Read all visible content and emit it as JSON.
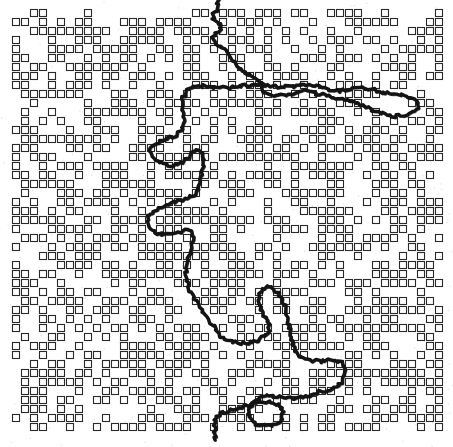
{
  "figure": {
    "title": "Percolation cluster lattice with hull walk",
    "width": 453,
    "height": 447,
    "background_color": "#ffffff"
  },
  "lattice": {
    "name": "occupied-site-lattice",
    "cell_size": 9,
    "cell_box": 7,
    "origin_x": 12,
    "origin_y": 9,
    "cols": 48,
    "rows": 47,
    "occupation_probability": 0.56,
    "square_stroke_color": "#2a2a2a",
    "square_stroke_width": 1.1,
    "square_fill": "none",
    "seed": 20240517
  },
  "hull": {
    "name": "hull-walk-path",
    "stroke_color": "#141414",
    "stroke_width": 3.4,
    "jitter_amplitude": 1.6,
    "entry_label": "top",
    "exit_label": "bottom",
    "points": [
      [
        218,
        0
      ],
      [
        218,
        9
      ],
      [
        214,
        12
      ],
      [
        213,
        19
      ],
      [
        217,
        22
      ],
      [
        221,
        24
      ],
      [
        221,
        31
      ],
      [
        216,
        34
      ],
      [
        213,
        38
      ],
      [
        215,
        44
      ],
      [
        220,
        47
      ],
      [
        226,
        50
      ],
      [
        230,
        56
      ],
      [
        234,
        60
      ],
      [
        238,
        66
      ],
      [
        243,
        70
      ],
      [
        248,
        74
      ],
      [
        253,
        78
      ],
      [
        258,
        80
      ],
      [
        262,
        85
      ],
      [
        264,
        91
      ],
      [
        269,
        94
      ],
      [
        275,
        95
      ],
      [
        282,
        95
      ],
      [
        289,
        95
      ],
      [
        296,
        93
      ],
      [
        303,
        91
      ],
      [
        310,
        92
      ],
      [
        317,
        94
      ],
      [
        324,
        95
      ],
      [
        331,
        97
      ],
      [
        338,
        98
      ],
      [
        345,
        100
      ],
      [
        352,
        102
      ],
      [
        359,
        104
      ],
      [
        366,
        107
      ],
      [
        373,
        110
      ],
      [
        380,
        113
      ],
      [
        387,
        115
      ],
      [
        394,
        116
      ],
      [
        401,
        116
      ],
      [
        408,
        114
      ],
      [
        414,
        111
      ],
      [
        418,
        107
      ],
      [
        419,
        102
      ],
      [
        416,
        98
      ],
      [
        409,
        96
      ],
      [
        402,
        95
      ],
      [
        395,
        94
      ],
      [
        388,
        93
      ],
      [
        381,
        92
      ],
      [
        374,
        90
      ],
      [
        367,
        88
      ],
      [
        360,
        87
      ],
      [
        353,
        88
      ],
      [
        346,
        90
      ],
      [
        339,
        91
      ],
      [
        332,
        90
      ],
      [
        325,
        88
      ],
      [
        318,
        86
      ],
      [
        311,
        85
      ],
      [
        304,
        85
      ],
      [
        297,
        86
      ],
      [
        290,
        87
      ],
      [
        283,
        87
      ],
      [
        276,
        86
      ],
      [
        269,
        85
      ],
      [
        262,
        84
      ],
      [
        255,
        84
      ],
      [
        248,
        85
      ],
      [
        241,
        86
      ],
      [
        234,
        87
      ],
      [
        227,
        88
      ],
      [
        220,
        88
      ],
      [
        213,
        87
      ],
      [
        206,
        86
      ],
      [
        199,
        86
      ],
      [
        192,
        88
      ],
      [
        186,
        92
      ],
      [
        183,
        98
      ],
      [
        182,
        105
      ],
      [
        183,
        112
      ],
      [
        184,
        119
      ],
      [
        184,
        126
      ],
      [
        181,
        132
      ],
      [
        175,
        136
      ],
      [
        168,
        138
      ],
      [
        161,
        140
      ],
      [
        155,
        143
      ],
      [
        151,
        148
      ],
      [
        150,
        154
      ],
      [
        153,
        159
      ],
      [
        158,
        162
      ],
      [
        164,
        164
      ],
      [
        171,
        165
      ],
      [
        178,
        164
      ],
      [
        184,
        161
      ],
      [
        189,
        157
      ],
      [
        193,
        152
      ],
      [
        197,
        148
      ],
      [
        201,
        152
      ],
      [
        203,
        158
      ],
      [
        203,
        165
      ],
      [
        202,
        172
      ],
      [
        201,
        179
      ],
      [
        200,
        186
      ],
      [
        197,
        192
      ],
      [
        192,
        196
      ],
      [
        186,
        199
      ],
      [
        179,
        201
      ],
      [
        172,
        203
      ],
      [
        165,
        205
      ],
      [
        158,
        208
      ],
      [
        152,
        212
      ],
      [
        148,
        217
      ],
      [
        147,
        224
      ],
      [
        150,
        230
      ],
      [
        156,
        233
      ],
      [
        163,
        234
      ],
      [
        170,
        234
      ],
      [
        177,
        233
      ],
      [
        183,
        231
      ],
      [
        188,
        228
      ],
      [
        192,
        233
      ],
      [
        193,
        240
      ],
      [
        192,
        247
      ],
      [
        190,
        254
      ],
      [
        188,
        261
      ],
      [
        187,
        268
      ],
      [
        186,
        275
      ],
      [
        187,
        282
      ],
      [
        189,
        289
      ],
      [
        192,
        295
      ],
      [
        196,
        301
      ],
      [
        200,
        307
      ],
      [
        204,
        313
      ],
      [
        208,
        319
      ],
      [
        212,
        325
      ],
      [
        216,
        331
      ],
      [
        221,
        336
      ],
      [
        227,
        340
      ],
      [
        234,
        342
      ],
      [
        241,
        343
      ],
      [
        248,
        343
      ],
      [
        255,
        342
      ],
      [
        261,
        339
      ],
      [
        266,
        335
      ],
      [
        269,
        330
      ],
      [
        268,
        323
      ],
      [
        265,
        317
      ],
      [
        262,
        311
      ],
      [
        260,
        304
      ],
      [
        259,
        297
      ],
      [
        261,
        291
      ],
      [
        266,
        287
      ],
      [
        272,
        288
      ],
      [
        277,
        292
      ],
      [
        281,
        298
      ],
      [
        284,
        304
      ],
      [
        286,
        311
      ],
      [
        288,
        318
      ],
      [
        289,
        325
      ],
      [
        290,
        332
      ],
      [
        291,
        339
      ],
      [
        293,
        346
      ],
      [
        296,
        352
      ],
      [
        301,
        357
      ],
      [
        307,
        360
      ],
      [
        314,
        361
      ],
      [
        321,
        361
      ],
      [
        328,
        360
      ],
      [
        335,
        360
      ],
      [
        341,
        363
      ],
      [
        344,
        369
      ],
      [
        344,
        376
      ],
      [
        341,
        382
      ],
      [
        336,
        386
      ],
      [
        330,
        389
      ],
      [
        323,
        391
      ],
      [
        316,
        393
      ],
      [
        309,
        395
      ],
      [
        302,
        397
      ],
      [
        295,
        398
      ],
      [
        288,
        398
      ],
      [
        281,
        397
      ],
      [
        274,
        396
      ],
      [
        267,
        396
      ],
      [
        260,
        398
      ],
      [
        254,
        402
      ],
      [
        250,
        407
      ],
      [
        249,
        414
      ],
      [
        251,
        420
      ],
      [
        256,
        424
      ],
      [
        262,
        426
      ],
      [
        269,
        426
      ],
      [
        276,
        424
      ],
      [
        281,
        420
      ],
      [
        283,
        414
      ],
      [
        281,
        408
      ],
      [
        276,
        404
      ],
      [
        269,
        402
      ],
      [
        262,
        402
      ],
      [
        255,
        403
      ],
      [
        248,
        405
      ],
      [
        241,
        407
      ],
      [
        234,
        409
      ],
      [
        227,
        411
      ],
      [
        220,
        413
      ],
      [
        216,
        418
      ],
      [
        215,
        425
      ],
      [
        215,
        433
      ],
      [
        215,
        440
      ]
    ]
  },
  "legend": {
    "lattice_label": "occupied sites",
    "hull_label": "hull walk"
  }
}
